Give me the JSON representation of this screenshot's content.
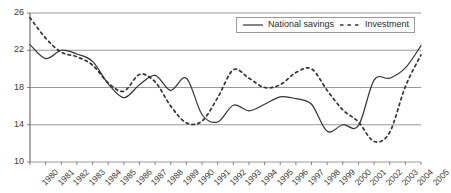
{
  "chart_data": {
    "type": "line",
    "title": "",
    "xlabel": "",
    "ylabel": "",
    "ylim": [
      10,
      26
    ],
    "yticks": [
      10,
      14,
      18,
      22,
      26
    ],
    "grid": true,
    "legend_position": "top-right",
    "categories": [
      "1980",
      "1981",
      "1982",
      "1983",
      "1984",
      "1985",
      "1986",
      "1987",
      "1988",
      "1989",
      "1990",
      "1991",
      "1992",
      "1993",
      "1994",
      "1995",
      "1996",
      "1997",
      "1998",
      "1999",
      "2000",
      "2001",
      "2002",
      "2003",
      "2004",
      "2005"
    ],
    "series": [
      {
        "name": "National savings",
        "style": "solid",
        "color": "#333333",
        "values": [
          22.6,
          21.1,
          22.0,
          21.6,
          20.8,
          18.4,
          16.9,
          18.3,
          19.3,
          17.7,
          19.0,
          15.1,
          14.3,
          16.1,
          15.5,
          16.2,
          17.0,
          16.8,
          16.2,
          13.3,
          14.0,
          13.9,
          18.8,
          19.0,
          20.1,
          22.5
        ]
      },
      {
        "name": "Investment",
        "style": "dashed",
        "color": "#333333",
        "values": [
          25.5,
          23.3,
          21.8,
          21.3,
          20.4,
          18.5,
          17.6,
          19.4,
          18.6,
          16.0,
          14.2,
          14.4,
          16.9,
          19.9,
          19.0,
          18.0,
          18.3,
          19.6,
          20.0,
          17.7,
          15.6,
          14.3,
          12.2,
          13.2,
          18.1,
          21.5
        ]
      }
    ]
  },
  "legend": {
    "items": [
      {
        "label": "National savings",
        "style": "solid"
      },
      {
        "label": "Investment",
        "style": "dashed"
      }
    ]
  }
}
